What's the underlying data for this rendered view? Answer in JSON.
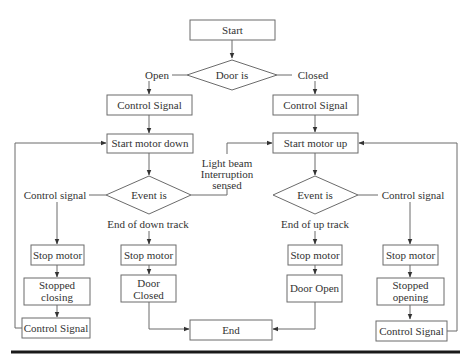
{
  "diagram": {
    "colors": {
      "stroke": "#6b6b6b",
      "text": "#333333",
      "rule": "#1a1a1a"
    },
    "nodes": {
      "start": {
        "label": "Start"
      },
      "door_is": {
        "label": "Door is"
      },
      "open_label": {
        "label": "Open"
      },
      "closed_label": {
        "label": "Closed"
      },
      "control_signal_left": {
        "label": "Control Signal"
      },
      "control_signal_right": {
        "label": "Control Signal"
      },
      "start_motor_down": {
        "label": "Start motor down"
      },
      "start_motor_up": {
        "label": "Start motor up"
      },
      "event_is_left": {
        "label": "Event is"
      },
      "event_is_right": {
        "label": "Event is"
      },
      "control_signal_branch_left": {
        "label": "Control signal"
      },
      "control_signal_branch_right": {
        "label": "Control signal"
      },
      "light_beam": {
        "line1": "Light beam",
        "line2": "Interruption",
        "line3": "sensed"
      },
      "end_of_down_track": {
        "label": "End of down track"
      },
      "end_of_up_track": {
        "label": "End of up track"
      },
      "stop_motor_left_outer": {
        "label": "Stop motor"
      },
      "stop_motor_left_inner": {
        "label": "Stop motor"
      },
      "stop_motor_right_inner": {
        "label": "Stop motor"
      },
      "stop_motor_right_outer": {
        "label": "Stop motor"
      },
      "stopped_closing": {
        "line1": "Stopped",
        "line2": "closing"
      },
      "stopped_opening": {
        "line1": "Stopped",
        "line2": "opening"
      },
      "door_closed": {
        "line1": "Door",
        "line2": "Closed"
      },
      "door_open": {
        "label": "Door Open"
      },
      "control_signal_bottom_left": {
        "label": "Control Signal"
      },
      "control_signal_bottom_right": {
        "label": "Control Signal"
      },
      "end": {
        "label": "End"
      }
    }
  }
}
